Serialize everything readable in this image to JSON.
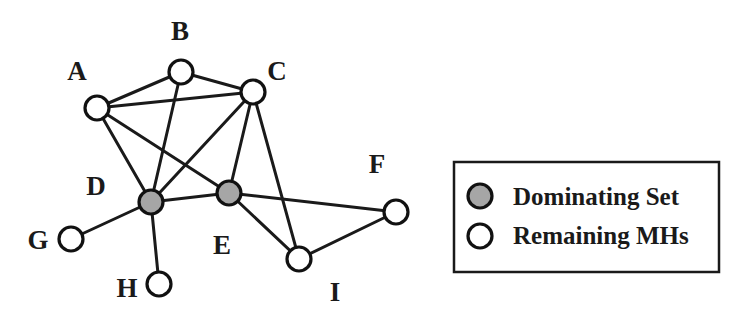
{
  "diagram": {
    "type": "graph",
    "colors": {
      "dominating_fill": "#a6a6a6",
      "remaining_fill": "#ffffff",
      "stroke": "#111111"
    },
    "nodes": [
      {
        "id": "A",
        "label": "A",
        "x": 97,
        "y": 108,
        "lx": 77,
        "ly": 80,
        "dominating": false
      },
      {
        "id": "B",
        "label": "B",
        "x": 181,
        "y": 72,
        "lx": 180,
        "ly": 40,
        "dominating": false
      },
      {
        "id": "C",
        "label": "C",
        "x": 253,
        "y": 92,
        "lx": 277,
        "ly": 80,
        "dominating": false
      },
      {
        "id": "D",
        "label": "D",
        "x": 151,
        "y": 202,
        "lx": 96,
        "ly": 195,
        "dominating": true
      },
      {
        "id": "E",
        "label": "E",
        "x": 229,
        "y": 193,
        "lx": 222,
        "ly": 254,
        "dominating": true
      },
      {
        "id": "F",
        "label": "F",
        "x": 396,
        "y": 212,
        "lx": 377,
        "ly": 173,
        "dominating": false
      },
      {
        "id": "G",
        "label": "G",
        "x": 71,
        "y": 239,
        "lx": 38,
        "ly": 249,
        "dominating": false
      },
      {
        "id": "H",
        "label": "H",
        "x": 159,
        "y": 284,
        "lx": 127,
        "ly": 297,
        "dominating": false
      },
      {
        "id": "I",
        "label": "I",
        "x": 299,
        "y": 259,
        "lx": 335,
        "ly": 301,
        "dominating": false
      }
    ],
    "edges": [
      [
        "A",
        "B"
      ],
      [
        "B",
        "C"
      ],
      [
        "A",
        "C"
      ],
      [
        "A",
        "D"
      ],
      [
        "A",
        "E"
      ],
      [
        "B",
        "D"
      ],
      [
        "C",
        "D"
      ],
      [
        "C",
        "E"
      ],
      [
        "C",
        "I"
      ],
      [
        "D",
        "E"
      ],
      [
        "D",
        "G"
      ],
      [
        "D",
        "H"
      ],
      [
        "E",
        "F"
      ],
      [
        "E",
        "I"
      ],
      [
        "I",
        "F"
      ]
    ]
  },
  "legend": {
    "items": [
      {
        "label": "Dominating Set",
        "fill": "#a6a6a6"
      },
      {
        "label": "Remaining MHs",
        "fill": "#ffffff"
      }
    ]
  }
}
